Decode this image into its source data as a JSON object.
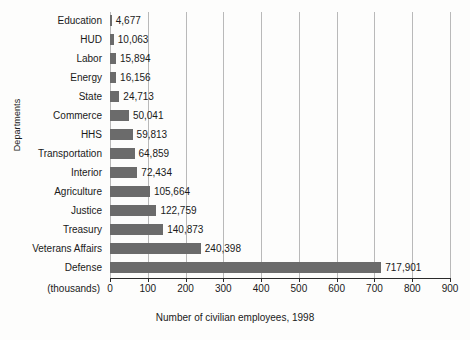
{
  "chart_data": {
    "type": "bar",
    "orientation": "horizontal",
    "title": "",
    "xlabel": "Number of civilian employees, 1998",
    "ylabel": "Departments",
    "x_units_label": "(thousands)",
    "categories": [
      "Education",
      "HUD",
      "Labor",
      "Energy",
      "State",
      "Commerce",
      "HHS",
      "Transportation",
      "Interior",
      "Agriculture",
      "Justice",
      "Treasury",
      "Veterans Affairs",
      "Defense"
    ],
    "values": [
      4677,
      10063,
      15894,
      16156,
      24713,
      50041,
      59813,
      64859,
      72434,
      105664,
      122759,
      140873,
      240398,
      717901
    ],
    "value_labels": [
      "4,677",
      "10,063",
      "15,894",
      "16,156",
      "24,713",
      "50,041",
      "59,813",
      "64,859",
      "72,434",
      "105,664",
      "122,759",
      "140,873",
      "240,398",
      "717,901"
    ],
    "xlim": [
      0,
      900000
    ],
    "xtick_values": [
      0,
      100,
      200,
      300,
      400,
      500,
      600,
      700,
      800,
      900
    ],
    "xtick_labels": [
      "0",
      "100",
      "200",
      "300",
      "400",
      "500",
      "600",
      "700",
      "800",
      "900"
    ],
    "grid": "vertical",
    "legend": "none",
    "bar_color": "#6b6b6b",
    "gridline_color": "#b9b9b9",
    "axis_color": "#2a2a2a",
    "background_color": "#fdfdfc"
  }
}
